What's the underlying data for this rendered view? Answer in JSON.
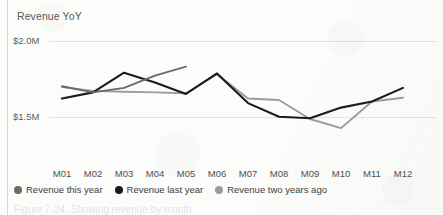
{
  "figure": {
    "title": "Revenue YoY",
    "caption_cut": "Figure 7-24. Showing revenue by month",
    "background_color": "#fcfcfb"
  },
  "legend": {
    "position": "bottom-left",
    "items": [
      {
        "label": "Revenue this year",
        "color": "#6b6b6b",
        "dot": "legend-dot-this-year"
      },
      {
        "label": "Revenue last year",
        "color": "#1a1a1a",
        "dot": "legend-dot-last-year"
      },
      {
        "label": "Revenue two years ago",
        "color": "#9b9b9b",
        "dot": "legend-dot-two-years-ago"
      }
    ]
  },
  "chart_data": {
    "type": "line",
    "title": "Revenue YoY",
    "xlabel": "",
    "ylabel": "",
    "grid": true,
    "gridlines": [
      "$1.5M",
      "$2.0M"
    ],
    "categories": [
      "M01",
      "M02",
      "M03",
      "M04",
      "M05",
      "M06",
      "M07",
      "M08",
      "M09",
      "M10",
      "M11",
      "M12"
    ],
    "ylim": [
      1.25,
      2.05
    ],
    "yticks": [
      1.5,
      2.0
    ],
    "ytick_labels": [
      "$1.5M",
      "$2.0M"
    ],
    "value_unit": "M",
    "series": [
      {
        "name": "Revenue this year",
        "color": "#6b6b6b",
        "values": [
          1.705,
          1.665,
          1.695,
          1.775,
          1.835,
          null,
          null,
          null,
          null,
          null,
          null,
          null
        ]
      },
      {
        "name": "Revenue last year",
        "color": "#1a1a1a",
        "values": [
          1.625,
          1.665,
          1.795,
          1.73,
          1.655,
          1.79,
          1.595,
          1.505,
          1.495,
          1.565,
          1.605,
          1.695
        ]
      },
      {
        "name": "Revenue two years ago",
        "color": "#9b9b9b",
        "values": [
          1.7,
          1.675,
          1.67,
          1.665,
          1.66,
          1.785,
          1.625,
          1.615,
          1.49,
          1.43,
          1.605,
          1.63
        ]
      }
    ]
  },
  "axes": {
    "x_tick_labels": [
      "M01",
      "M02",
      "M03",
      "M04",
      "M05",
      "M06",
      "M07",
      "M08",
      "M09",
      "M10",
      "M11",
      "M12"
    ],
    "y_tick_labels": [
      "$2.0M",
      "$1.5M"
    ]
  }
}
